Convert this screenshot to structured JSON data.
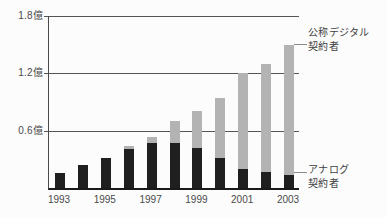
{
  "chart_data": {
    "type": "bar",
    "stacked": true,
    "title": "",
    "xlabel": "",
    "ylabel": "",
    "unit": "億",
    "ylim": [
      0,
      1.8
    ],
    "grid": true,
    "categories": [
      "1993",
      "1994",
      "1995",
      "1996",
      "1997",
      "1998",
      "1999",
      "2000",
      "2001",
      "2002",
      "2003"
    ],
    "series": [
      {
        "name": "アナログ契約者",
        "color": "#1f1f1f",
        "values": [
          0.16,
          0.24,
          0.31,
          0.41,
          0.47,
          0.47,
          0.42,
          0.31,
          0.2,
          0.17,
          0.14
        ]
      },
      {
        "name": "公称デジタル契約者",
        "color": "#b3b3b3",
        "values": [
          0,
          0,
          0,
          0.03,
          0.06,
          0.23,
          0.39,
          0.63,
          1.0,
          1.13,
          1.36
        ]
      }
    ],
    "y_ticks": [
      {
        "label": "0.6億",
        "value": 0.6
      },
      {
        "label": "1.2億",
        "value": 1.2
      },
      {
        "label": "1.8億",
        "value": 1.8
      }
    ],
    "x_tick_labels": [
      "1993",
      "1995",
      "1997",
      "1999",
      "2001",
      "2003"
    ],
    "annotations": [
      {
        "id": "digital",
        "line1": "公称デジタル",
        "line2": "契約者",
        "series": "公称デジタル契約者"
      },
      {
        "id": "analog",
        "line1": "アナログ",
        "line2": "契約者",
        "series": "アナログ契約者"
      }
    ],
    "legend_position": "right-annotations"
  }
}
